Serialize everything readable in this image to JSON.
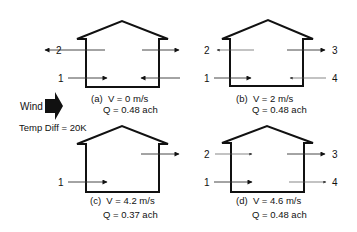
{
  "legend": {
    "wind_label": "Wind",
    "temp_diff_label": "Temp Diff = 20K",
    "wind_icon": "wind-arrow-icon"
  },
  "colors": {
    "line": "#111111",
    "background": "#ffffff"
  },
  "panels": [
    {
      "id": "a",
      "caption_line1": "(a)  V = 0 m/s",
      "caption_line2": "Q = 0.48 ach",
      "velocity": "0 m/s",
      "air_change_rate": "0.48 ach",
      "openings": [
        {
          "label": "2",
          "level": "upper-left",
          "direction": "out"
        },
        {
          "label": "3",
          "level": "upper-right",
          "direction": "out"
        },
        {
          "label": "1",
          "level": "lower-left",
          "direction": "in"
        },
        {
          "label": "4",
          "level": "lower-right",
          "direction": "in"
        }
      ]
    },
    {
      "id": "b",
      "caption_line1": "(b)  V = 2 m/s",
      "caption_line2": "Q = 0.48 ach",
      "velocity": "2 m/s",
      "air_change_rate": "0.48 ach",
      "openings": [
        {
          "label": "2",
          "level": "upper-left",
          "direction": "out"
        },
        {
          "label": "3",
          "level": "upper-right",
          "direction": "out"
        },
        {
          "label": "1",
          "level": "lower-left",
          "direction": "in"
        },
        {
          "label": "4",
          "level": "lower-right",
          "direction": "in"
        }
      ]
    },
    {
      "id": "c",
      "caption_line1": "(c)  V = 4.2 m/s",
      "caption_line2": "Q = 0.37 ach",
      "velocity": "4.2 m/s",
      "air_change_rate": "0.37 ach",
      "openings": [
        {
          "label": "",
          "level": "upper-right",
          "direction": "out"
        },
        {
          "label": "1",
          "level": "lower-left",
          "direction": "in"
        }
      ]
    },
    {
      "id": "d",
      "caption_line1": "(d)  V = 4.6 m/s",
      "caption_line2": "Q = 0.48 ach",
      "velocity": "4.6 m/s",
      "air_change_rate": "0.48 ach",
      "openings": [
        {
          "label": "2",
          "level": "upper-left",
          "direction": "in"
        },
        {
          "label": "3",
          "level": "upper-right",
          "direction": "out"
        },
        {
          "label": "1",
          "level": "lower-left",
          "direction": "in"
        },
        {
          "label": "4",
          "level": "lower-right",
          "direction": "out"
        }
      ]
    }
  ]
}
